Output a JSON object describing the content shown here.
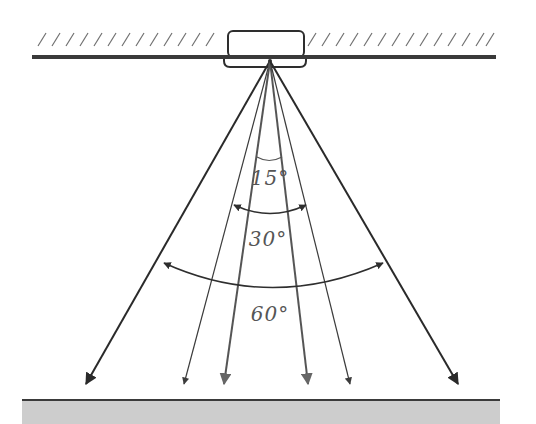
{
  "diagram": {
    "colors": {
      "background": "#ffffff",
      "ceiling_line": "#3a3a3a",
      "hatch": "#707070",
      "fixture_stroke": "#2e2e2e",
      "beam_dark": "#2a2a2a",
      "beam_mid": "#555555",
      "beam_light": "#6a6a6a",
      "floor_fill": "#cdcdcd",
      "floor_line": "#3a3a3a",
      "label": "#555555"
    },
    "ceiling": {
      "y": 57,
      "x_start": 32,
      "x_end": 496
    },
    "fixture": {
      "x": 228,
      "y": 31,
      "width": 76,
      "height": 26,
      "origin_x": 270,
      "origin_y": 60
    },
    "floor": {
      "y": 400,
      "x_start": 22,
      "x_end": 500
    },
    "beams": [
      {
        "name": "60-left",
        "tip_x": 86,
        "tip_y": 385
      },
      {
        "name": "30-left",
        "tip_x": 184,
        "tip_y": 385
      },
      {
        "name": "15-left",
        "tip_x": 224,
        "tip_y": 385
      },
      {
        "name": "15-right",
        "tip_x": 306,
        "tip_y": 385
      },
      {
        "name": "30-right",
        "tip_x": 348,
        "tip_y": 385
      },
      {
        "name": "60-right",
        "tip_x": 458,
        "tip_y": 385
      }
    ],
    "angles": [
      {
        "label": "15°",
        "value": 15
      },
      {
        "label": "30°",
        "value": 30
      },
      {
        "label": "60°",
        "value": 60
      }
    ]
  }
}
